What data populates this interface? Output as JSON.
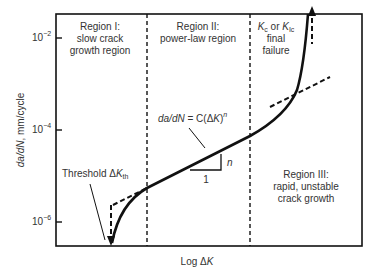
{
  "diagram": {
    "axes": {
      "x_label_prefix": "Log ",
      "x_label_delta": "Δ",
      "x_label_var": "K",
      "y_label_italic1": "da/dN",
      "y_label_rest": ", mm/cycle",
      "y_ticks": [
        {
          "base": "10",
          "exp": "−2"
        },
        {
          "base": "10",
          "exp": "−4"
        },
        {
          "base": "10",
          "exp": "−6"
        }
      ]
    },
    "regions": [
      {
        "lines": [
          "Region I:",
          "slow crack",
          "growth region"
        ]
      },
      {
        "lines": [
          "Region II:",
          "power-law region"
        ]
      },
      {
        "lines": [
          "Region III:",
          "rapid, unstable",
          "crack growth"
        ]
      }
    ],
    "annotations": {
      "failure_k1": "K",
      "failure_k1_sub": "c",
      "failure_or": " or ",
      "failure_k2": "K",
      "failure_k2_sub": "Ic",
      "failure_line2": "final",
      "failure_line3": "failure",
      "threshold_text": "Threshold Δ",
      "threshold_k": "K",
      "threshold_sub": "th",
      "equation_lhs": "da/dN",
      "equation_mid": " = C(Δ",
      "equation_k": "K",
      "equation_close": ")",
      "equation_exp": "n",
      "slope_rise": "n",
      "slope_run": "1"
    }
  }
}
